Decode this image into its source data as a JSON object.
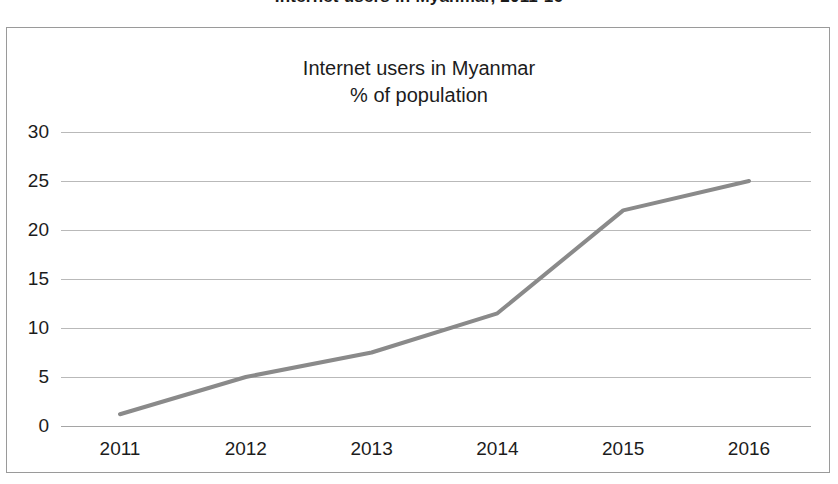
{
  "top_caption": "Internet users in Myanmar, 2011-16",
  "chart_title": {
    "line1": "Internet users in Myanmar",
    "line2": "% of population"
  },
  "colors": {
    "line": "#8a8a8a",
    "gridline": "#b9b9b9",
    "axis": "#a5a5a5",
    "border": "#9a9a9a",
    "text": "#1c1c1c",
    "background": "#ffffff"
  },
  "chart_data": {
    "type": "line",
    "title": "Internet users in Myanmar\n% of population",
    "xlabel": "",
    "ylabel": "",
    "categories": [
      "2011",
      "2012",
      "2013",
      "2014",
      "2015",
      "2016"
    ],
    "x": [
      2011,
      2012,
      2013,
      2014,
      2015,
      2016
    ],
    "values": [
      1.2,
      5.0,
      7.5,
      11.5,
      22.0,
      25.0
    ],
    "series": [
      {
        "name": "Internet users (% of population)",
        "values": [
          1.2,
          5.0,
          7.5,
          11.5,
          22.0,
          25.0
        ]
      }
    ],
    "yticks": [
      0,
      5,
      10,
      15,
      20,
      25,
      30
    ],
    "ytick_labels": [
      "0",
      "5",
      "10",
      "15",
      "20",
      "25",
      "30"
    ],
    "ylim": [
      0,
      30
    ],
    "xtick_labels": [
      "2011",
      "2012",
      "2013",
      "2014",
      "2015",
      "2016"
    ],
    "grid": "horizontal",
    "legend": "none",
    "markers": "none",
    "line_width": 4
  }
}
